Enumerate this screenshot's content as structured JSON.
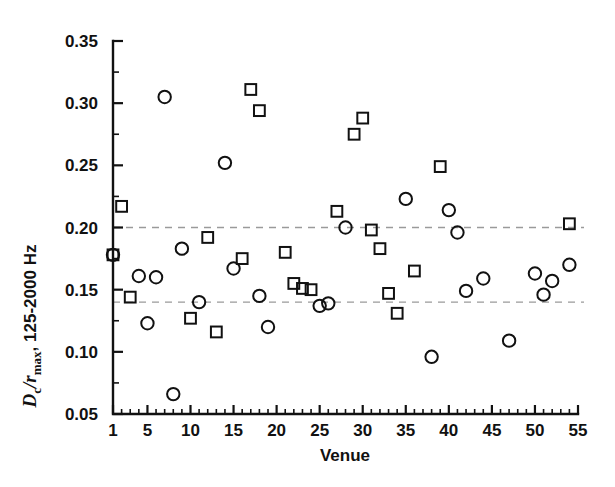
{
  "chart_data": {
    "type": "scatter",
    "title": "",
    "xlabel": "Venue",
    "ylabel": "Dc/rmax, 125-2000 Hz",
    "ylabel_parts": {
      "italic_d": "D",
      "sub_c": "c",
      "slash": "/",
      "italic_r": "r",
      "sub_max": "max",
      "rest": ", 125-2000 Hz"
    },
    "xlim": [
      1,
      55
    ],
    "ylim": [
      0.05,
      0.35
    ],
    "xticks": [
      1,
      5,
      10,
      15,
      20,
      25,
      30,
      35,
      40,
      45,
      50,
      55
    ],
    "xtick_labels": [
      "1",
      "5",
      "10",
      "15",
      "20",
      "25",
      "30",
      "35",
      "40",
      "45",
      "50",
      "55"
    ],
    "yticks": [
      0.05,
      0.1,
      0.15,
      0.2,
      0.25,
      0.3,
      0.35
    ],
    "ytick_labels": [
      "0.05",
      "0.10",
      "0.15",
      "0.20",
      "0.25",
      "0.30",
      "0.35"
    ],
    "y_minor_ticks": [
      0.075,
      0.125,
      0.175,
      0.225,
      0.275,
      0.325
    ],
    "x_minor_tick_step": 1,
    "grid": false,
    "legend": "none",
    "reference_lines": [
      {
        "name": "upper-reference-line",
        "y": 0.2,
        "style": "dashed",
        "color": "#9a9a9a"
      },
      {
        "name": "lower-reference-line",
        "y": 0.14,
        "style": "dashed",
        "color": "#9a9a9a"
      }
    ],
    "marker_colors": {
      "circle": "#111111",
      "square": "#111111"
    },
    "series": [
      {
        "name": "Circles",
        "marker": "circle",
        "points": [
          {
            "x": 1,
            "y": 0.178
          },
          {
            "x": 4,
            "y": 0.161
          },
          {
            "x": 5,
            "y": 0.123
          },
          {
            "x": 6,
            "y": 0.16
          },
          {
            "x": 8,
            "y": 0.066
          },
          {
            "x": 7,
            "y": 0.305
          },
          {
            "x": 9,
            "y": 0.183
          },
          {
            "x": 11,
            "y": 0.14
          },
          {
            "x": 14,
            "y": 0.252
          },
          {
            "x": 15,
            "y": 0.167
          },
          {
            "x": 18,
            "y": 0.145
          },
          {
            "x": 19,
            "y": 0.12
          },
          {
            "x": 25,
            "y": 0.137
          },
          {
            "x": 26,
            "y": 0.139
          },
          {
            "x": 28,
            "y": 0.2
          },
          {
            "x": 35,
            "y": 0.223
          },
          {
            "x": 38,
            "y": 0.096
          },
          {
            "x": 40,
            "y": 0.214
          },
          {
            "x": 41,
            "y": 0.196
          },
          {
            "x": 42,
            "y": 0.149
          },
          {
            "x": 44,
            "y": 0.159
          },
          {
            "x": 47,
            "y": 0.109
          },
          {
            "x": 50,
            "y": 0.163
          },
          {
            "x": 51,
            "y": 0.146
          },
          {
            "x": 52,
            "y": 0.157
          },
          {
            "x": 54,
            "y": 0.17
          }
        ]
      },
      {
        "name": "Squares",
        "marker": "square",
        "points": [
          {
            "x": 1,
            "y": 0.178
          },
          {
            "x": 2,
            "y": 0.217
          },
          {
            "x": 3,
            "y": 0.144
          },
          {
            "x": 10,
            "y": 0.127
          },
          {
            "x": 12,
            "y": 0.192
          },
          {
            "x": 13,
            "y": 0.116
          },
          {
            "x": 16,
            "y": 0.175
          },
          {
            "x": 17,
            "y": 0.311
          },
          {
            "x": 18,
            "y": 0.294
          },
          {
            "x": 21,
            "y": 0.18
          },
          {
            "x": 22,
            "y": 0.155
          },
          {
            "x": 23,
            "y": 0.151
          },
          {
            "x": 24,
            "y": 0.15
          },
          {
            "x": 27,
            "y": 0.213
          },
          {
            "x": 29,
            "y": 0.275
          },
          {
            "x": 30,
            "y": 0.288
          },
          {
            "x": 31,
            "y": 0.198
          },
          {
            "x": 32,
            "y": 0.183
          },
          {
            "x": 33,
            "y": 0.147
          },
          {
            "x": 34,
            "y": 0.131
          },
          {
            "x": 36,
            "y": 0.165
          },
          {
            "x": 39,
            "y": 0.249
          },
          {
            "x": 54,
            "y": 0.203
          }
        ]
      }
    ]
  }
}
